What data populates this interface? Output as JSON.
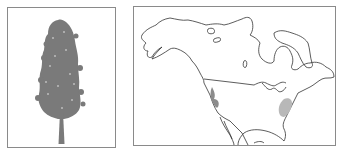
{
  "figure": {
    "left_panel": {
      "subject": "tree-illustration",
      "description": "Tall conifer tree silhouette with narrow columnar crown and straight trunk",
      "fill_color": "#7a7a7a"
    },
    "right_panel": {
      "subject": "range-map",
      "region": "North America",
      "outline_color": "#333333",
      "ranges": [
        {
          "name": "western-range",
          "location": "Pacific coast / Sierra Nevada",
          "color": "#8c8c8c"
        },
        {
          "name": "eastern-range",
          "location": "Mid-Atlantic / Appalachian",
          "color": "#b8b8b8"
        }
      ]
    },
    "frame_color": "#8a8a8a",
    "background": "#ffffff"
  }
}
